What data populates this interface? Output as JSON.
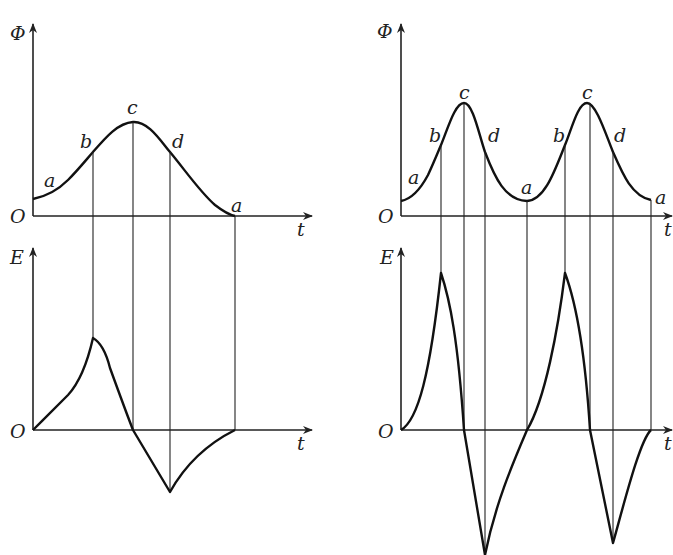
{
  "figure": {
    "left": {
      "flux_plot": {
        "y_label": "Φ",
        "x_label": "t",
        "origin_label": "O",
        "point_labels": [
          "a",
          "b",
          "c",
          "d",
          "a"
        ]
      },
      "emf_plot": {
        "y_label": "E",
        "x_label": "t",
        "origin_label": "O"
      }
    },
    "right": {
      "flux_plot": {
        "y_label": "Φ",
        "x_label": "t",
        "origin_label": "O",
        "point_labels": [
          "a",
          "b",
          "c",
          "d",
          "a",
          "b",
          "c",
          "d",
          "a"
        ]
      },
      "emf_plot": {
        "y_label": "E",
        "x_label": "t",
        "origin_label": "O"
      }
    }
  },
  "colors": {
    "line": "#111111",
    "background": "#ffffff"
  }
}
